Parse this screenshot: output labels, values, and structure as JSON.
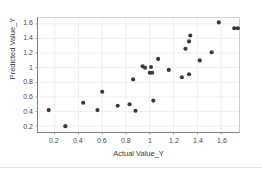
{
  "chart_data": {
    "type": "scatter",
    "title": "",
    "xlabel": "Actual Value_Y",
    "ylabel": "Predicted Value_Y",
    "xlim": [
      0.06,
      1.75
    ],
    "ylim": [
      0.12,
      1.68
    ],
    "xticks": [
      "0.2",
      "0.4",
      "0.6",
      "0.8",
      "1",
      "1.2",
      "1.4",
      "1.6"
    ],
    "xtick_values": [
      0.2,
      0.4,
      0.6,
      0.8,
      1.0,
      1.2,
      1.4,
      1.6
    ],
    "yticks": [
      "0.2",
      "0.4",
      "0.6",
      "0.8",
      "1",
      "1.2",
      "1.4",
      "1.6"
    ],
    "ytick_values": [
      0.2,
      0.4,
      0.6,
      0.8,
      1.0,
      1.2,
      1.4,
      1.6
    ],
    "grid": true,
    "legend": false,
    "marker_color": "#3a3a3a",
    "marker_size": 2.1,
    "series": [
      {
        "name": "Predicted vs Actual",
        "points": [
          [
            0.15,
            0.42
          ],
          [
            0.29,
            0.2
          ],
          [
            0.44,
            0.52
          ],
          [
            0.6,
            0.67
          ],
          [
            0.56,
            0.42
          ],
          [
            0.73,
            0.48
          ],
          [
            0.83,
            0.5
          ],
          [
            0.88,
            0.41
          ],
          [
            0.86,
            0.84
          ],
          [
            0.94,
            1.02
          ],
          [
            0.96,
            1.0
          ],
          [
            1.01,
            1.01
          ],
          [
            1.0,
            0.93
          ],
          [
            1.02,
            0.93
          ],
          [
            1.07,
            1.12
          ],
          [
            1.03,
            0.55
          ],
          [
            1.16,
            0.97
          ],
          [
            1.27,
            0.87
          ],
          [
            1.3,
            1.26
          ],
          [
            1.33,
            1.36
          ],
          [
            1.34,
            1.44
          ],
          [
            1.33,
            0.91
          ],
          [
            1.42,
            1.1
          ],
          [
            1.52,
            1.21
          ],
          [
            1.58,
            1.62
          ],
          [
            1.71,
            1.54
          ],
          [
            1.74,
            1.54
          ],
          [
            1.84,
            1.2
          ]
        ]
      }
    ]
  },
  "axes": {
    "y_title": "Predicted Value_Y",
    "x_title": "Actual Value_Y"
  }
}
